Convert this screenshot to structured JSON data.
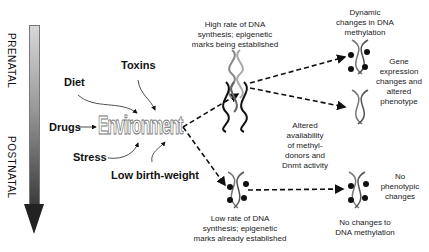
{
  "timeline": {
    "prenatal_label": "PRENATAL",
    "postnatal_label": "POSTNATAL"
  },
  "factors": {
    "diet": "Diet",
    "toxins": "Toxins",
    "drugs": "Drugs",
    "stress": "Stress",
    "low_birth_weight": "Low birth-weight"
  },
  "center": {
    "label": "Environment"
  },
  "prenatal_path": {
    "caption_lines": [
      "High rate of DNA",
      "synthesis; epigenetic",
      "marks being established"
    ],
    "outcome_top": {
      "caption_lines": [
        "Dynamic",
        "changes in DNA",
        "methylation"
      ]
    },
    "outcome_side": {
      "caption_lines": [
        "Gene",
        "expression",
        "changes and",
        "altered",
        "phenotype"
      ]
    }
  },
  "middle_note": {
    "caption_lines": [
      "Altered",
      "availability",
      "of methyl-",
      "donors and",
      "Dnmt activity"
    ]
  },
  "postnatal_path": {
    "caption_lines": [
      "Low rate of DNA",
      "synthesis; epigenetic",
      "marks already established"
    ],
    "outcome_bottom": {
      "caption_lines": [
        "No changes to",
        "DNA methylation"
      ]
    },
    "outcome_side": {
      "caption_lines": [
        "No",
        "phenotypic",
        "changes"
      ]
    }
  },
  "colors": {
    "arrow": "#111111",
    "gradient_top": "#d8d8d8",
    "gradient_bottom": "#3a3a3a"
  }
}
